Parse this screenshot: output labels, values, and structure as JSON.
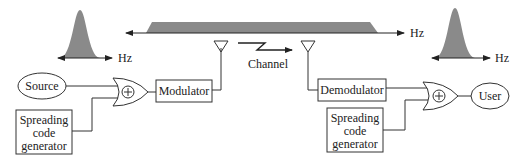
{
  "diagram": {
    "colors": {
      "line": "#333333",
      "spectrum": "#8a8a8a",
      "background": "#ffffff"
    },
    "transmitter": {
      "source_label": "Source",
      "spreading_code_generator_lines": [
        "Spreading",
        "code",
        "generator"
      ],
      "xor_symbol": "+",
      "modulator_label": "Modulator"
    },
    "channel": {
      "label": "Channel"
    },
    "receiver": {
      "demodulator_label": "Demodulator",
      "spreading_code_generator_lines": [
        "Spreading",
        "code",
        "generator"
      ],
      "xor_symbol": "+",
      "user_label": "User"
    },
    "spectra": {
      "narrowband_tx_axis": "Hz",
      "wideband_axis": "Hz",
      "narrowband_rx_axis": "Hz"
    }
  }
}
